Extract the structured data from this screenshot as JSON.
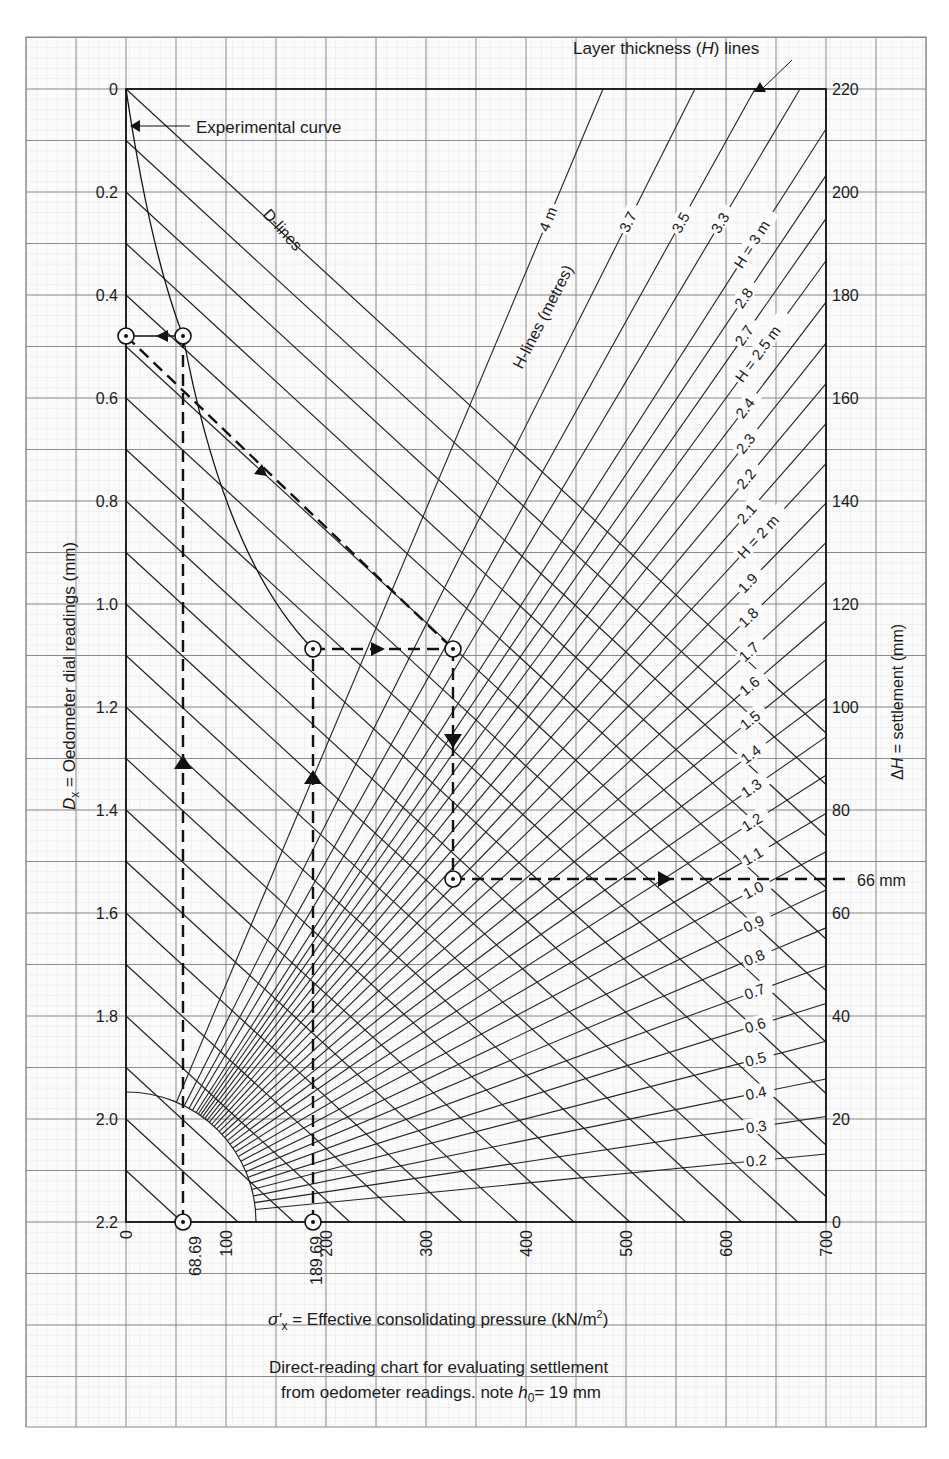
{
  "chart_data": {
    "type": "line",
    "caption_line1": "Direct-reading chart for evaluating settlement",
    "caption_line2_prefix": "from oedometer readings. note ",
    "caption_h0_symbol": "h",
    "caption_h0_sub": "0",
    "caption_h0_value": "= 19 mm",
    "xlabel": "σ′x = Effective consolidating pressure (kN/m²)",
    "xlabel_sigma": "σ′",
    "xlabel_sub": "x",
    "xlabel_text": " = Effective consolidating pressure (kN/m",
    "xlabel_sup": "2",
    "xlabel_close": ")",
    "ylabel_left": "Dx = Oedometer dial readings (mm)",
    "ylabel_left_D": "D",
    "ylabel_left_sub": "x",
    "ylabel_left_text": " = Oedometer dial readings (mm)",
    "ylabel_right": "ΔH = settlement (mm)",
    "ylabel_right_delta": "Δ",
    "ylabel_right_H": "H",
    "ylabel_right_text": " = settlement (mm)",
    "xlim": [
      0,
      700
    ],
    "ylim_left": [
      0,
      2.2
    ],
    "ylim_right": [
      0,
      220
    ],
    "x_ticks": [
      "0",
      "100",
      "200",
      "300",
      "400",
      "500",
      "600",
      "700"
    ],
    "x_special_ticks": [
      "68.69",
      "189.69"
    ],
    "y_left_ticks": [
      "0",
      "0.2",
      "0.4",
      "0.6",
      "0.8",
      "1.0",
      "1.2",
      "1.4",
      "1.6",
      "1.8",
      "2.0",
      "2.2"
    ],
    "y_right_ticks": [
      "220",
      "200",
      "180",
      "160",
      "140",
      "120",
      "100",
      "80",
      "60",
      "40",
      "20",
      "0"
    ],
    "grid": true,
    "annotations": {
      "experimental_curve": "Experimental curve",
      "d_lines": "D-lines",
      "h_lines": "H-lines (metres)",
      "layer_thickness_prefix": "Layer thickness (",
      "layer_thickness_H": "H",
      "layer_thickness_suffix": ") lines",
      "result": "66 mm"
    },
    "h_line_labels": [
      "4 m",
      "3.7",
      "3.5",
      "3.3",
      "H = 3 m",
      "2.8",
      "2.7",
      "H = 2.5 m",
      "2.4",
      "2.3",
      "2.2",
      "2.1",
      "H = 2 m",
      "1.9",
      "1.8",
      "1.7",
      "1.6",
      "1.5",
      "1.4",
      "1.3",
      "1.2",
      "1.1",
      "1.0",
      "0.9",
      "0.8",
      "0.7",
      "0.6",
      "0.5",
      "0.4",
      "0.3",
      "0.2"
    ],
    "series": [
      {
        "name": "Experimental curve",
        "x": [
          0,
          68.69,
          120,
          189.69
        ],
        "y": [
          0,
          0.48,
          0.8,
          1.08
        ]
      },
      {
        "name": "Reading path",
        "points": [
          {
            "x": 68.69,
            "y_mm": 2.2,
            "note": "start at pressure 68.69"
          },
          {
            "x": 68.69,
            "y_mm": 0.48
          },
          {
            "x": 0,
            "y_mm": 0.48
          },
          {
            "x": 328,
            "y_mm": 1.08
          },
          {
            "x": 189.69,
            "y_mm": 1.08
          },
          {
            "x": 189.69,
            "y_mm": 2.2,
            "note": "start at pressure 189.69"
          },
          {
            "x": 328,
            "y_mm": 1.54
          },
          {
            "x": 700,
            "settlement_mm": 66
          }
        ]
      }
    ],
    "result_settlement_mm": 66
  }
}
